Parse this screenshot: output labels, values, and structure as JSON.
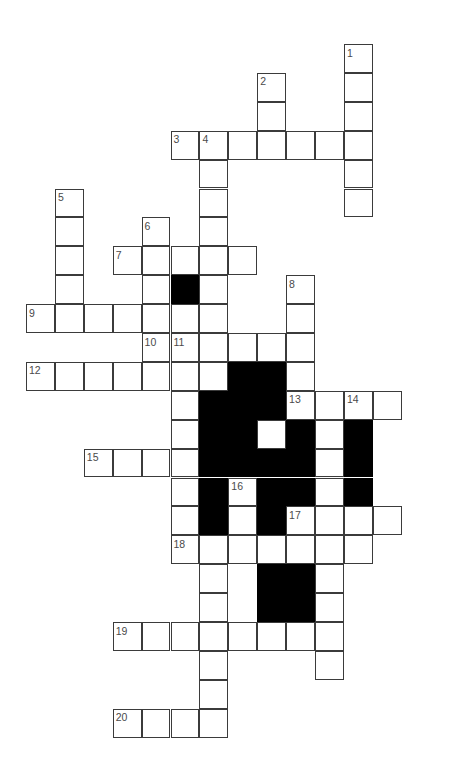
{
  "puzzle": {
    "kind": "crossword-grid",
    "title": "",
    "geometry": {
      "origin_x": 26,
      "origin_y": 44,
      "cell": 28.9,
      "cols": 15,
      "rows": 26
    },
    "colors": {
      "background": "#ffffff",
      "cell_fill": "#ffffff",
      "cell_border": "#3b3b3b",
      "block_fill": "#000000",
      "number_text": "#4a4a4a"
    },
    "open_cells": [
      [
        11,
        0
      ],
      [
        11,
        1
      ],
      [
        8,
        1
      ],
      [
        11,
        2
      ],
      [
        8,
        2
      ],
      [
        5,
        3
      ],
      [
        6,
        3
      ],
      [
        7,
        3
      ],
      [
        8,
        3
      ],
      [
        9,
        3
      ],
      [
        10,
        3
      ],
      [
        11,
        3
      ],
      [
        6,
        4
      ],
      [
        11,
        4
      ],
      [
        1,
        5
      ],
      [
        6,
        5
      ],
      [
        11,
        5
      ],
      [
        1,
        6
      ],
      [
        4,
        6
      ],
      [
        6,
        6
      ],
      [
        1,
        7
      ],
      [
        3,
        7
      ],
      [
        4,
        7
      ],
      [
        5,
        7
      ],
      [
        6,
        7
      ],
      [
        7,
        7
      ],
      [
        1,
        8
      ],
      [
        4,
        8
      ],
      [
        5,
        8
      ],
      [
        6,
        8
      ],
      [
        9,
        8
      ],
      [
        0,
        9
      ],
      [
        1,
        9
      ],
      [
        2,
        9
      ],
      [
        3,
        9
      ],
      [
        4,
        9
      ],
      [
        5,
        9
      ],
      [
        6,
        9
      ],
      [
        9,
        9
      ],
      [
        4,
        10
      ],
      [
        5,
        10
      ],
      [
        6,
        10
      ],
      [
        7,
        10
      ],
      [
        8,
        10
      ],
      [
        9,
        10
      ],
      [
        0,
        11
      ],
      [
        1,
        11
      ],
      [
        2,
        11
      ],
      [
        3,
        11
      ],
      [
        4,
        11
      ],
      [
        5,
        11
      ],
      [
        6,
        11
      ],
      [
        7,
        11
      ],
      [
        8,
        11
      ],
      [
        9,
        11
      ],
      [
        5,
        12
      ],
      [
        6,
        12
      ],
      [
        7,
        12
      ],
      [
        8,
        12
      ],
      [
        9,
        12
      ],
      [
        10,
        12
      ],
      [
        11,
        12
      ],
      [
        12,
        12
      ],
      [
        5,
        13
      ],
      [
        8,
        13
      ],
      [
        10,
        13
      ],
      [
        2,
        14
      ],
      [
        3,
        14
      ],
      [
        4,
        14
      ],
      [
        5,
        14
      ],
      [
        10,
        14
      ],
      [
        5,
        15
      ],
      [
        7,
        15
      ],
      [
        10,
        15
      ],
      [
        5,
        16
      ],
      [
        7,
        16
      ],
      [
        9,
        16
      ],
      [
        10,
        16
      ],
      [
        11,
        16
      ],
      [
        12,
        16
      ],
      [
        5,
        17
      ],
      [
        6,
        17
      ],
      [
        7,
        17
      ],
      [
        8,
        17
      ],
      [
        9,
        17
      ],
      [
        10,
        17
      ],
      [
        11,
        17
      ],
      [
        6,
        18
      ],
      [
        10,
        18
      ],
      [
        6,
        19
      ],
      [
        10,
        19
      ],
      [
        3,
        20
      ],
      [
        4,
        20
      ],
      [
        5,
        20
      ],
      [
        6,
        20
      ],
      [
        7,
        20
      ],
      [
        8,
        20
      ],
      [
        9,
        20
      ],
      [
        10,
        20
      ],
      [
        6,
        21
      ],
      [
        10,
        21
      ],
      [
        6,
        22
      ],
      [
        3,
        23
      ],
      [
        4,
        23
      ],
      [
        5,
        23
      ],
      [
        6,
        23
      ]
    ],
    "block_cells": [
      [
        5,
        8
      ],
      [
        7,
        11
      ],
      [
        8,
        11
      ],
      [
        6,
        12
      ],
      [
        7,
        12
      ],
      [
        8,
        12
      ],
      [
        6,
        13
      ],
      [
        7,
        13
      ],
      [
        9,
        13
      ],
      [
        11,
        13
      ],
      [
        6,
        14
      ],
      [
        7,
        14
      ],
      [
        8,
        14
      ],
      [
        9,
        14
      ],
      [
        11,
        14
      ],
      [
        6,
        15
      ],
      [
        8,
        15
      ],
      [
        9,
        15
      ],
      [
        11,
        15
      ],
      [
        6,
        16
      ],
      [
        8,
        16
      ],
      [
        8,
        18
      ],
      [
        9,
        18
      ],
      [
        8,
        19
      ],
      [
        9,
        19
      ]
    ],
    "numbers": [
      {
        "n": "1",
        "col": 11,
        "row": 0
      },
      {
        "n": "2",
        "col": 8,
        "row": 1
      },
      {
        "n": "3",
        "col": 5,
        "row": 3
      },
      {
        "n": "4",
        "col": 6,
        "row": 3
      },
      {
        "n": "5",
        "col": 1,
        "row": 5
      },
      {
        "n": "6",
        "col": 4,
        "row": 6
      },
      {
        "n": "7",
        "col": 3,
        "row": 7
      },
      {
        "n": "8",
        "col": 9,
        "row": 8
      },
      {
        "n": "9",
        "col": 0,
        "row": 9
      },
      {
        "n": "10",
        "col": 4,
        "row": 10
      },
      {
        "n": "11",
        "col": 5,
        "row": 10
      },
      {
        "n": "12",
        "col": 0,
        "row": 11
      },
      {
        "n": "13",
        "col": 9,
        "row": 12
      },
      {
        "n": "14",
        "col": 11,
        "row": 12
      },
      {
        "n": "15",
        "col": 2,
        "row": 14
      },
      {
        "n": "16",
        "col": 7,
        "row": 15
      },
      {
        "n": "17",
        "col": 9,
        "row": 16
      },
      {
        "n": "18",
        "col": 5,
        "row": 17
      },
      {
        "n": "19",
        "col": 3,
        "row": 20
      },
      {
        "n": "20",
        "col": 3,
        "row": 23
      }
    ]
  }
}
